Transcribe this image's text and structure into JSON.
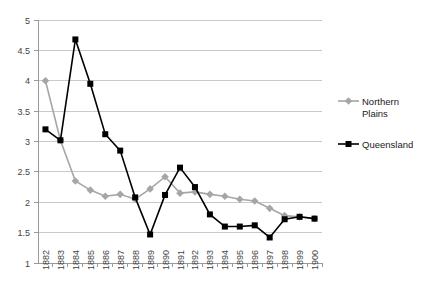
{
  "chart_data": {
    "type": "line",
    "title": "",
    "xlabel": "",
    "ylabel": "",
    "ylim": [
      1,
      5
    ],
    "ytick_step": 0.5,
    "yticks": [
      "1",
      "1.5",
      "2",
      "2.5",
      "3",
      "3.5",
      "4",
      "4.5",
      "5"
    ],
    "grid": true,
    "legend_position": "right",
    "categories": [
      "1882",
      "1883",
      "1884",
      "1885",
      "1886",
      "1887",
      "1888",
      "1889",
      "1890",
      "1891",
      "1892",
      "1893",
      "1894",
      "1895",
      "1896",
      "1897",
      "1898",
      "1899",
      "1900"
    ],
    "series": [
      {
        "name": "Northern Plains",
        "color": "#a6a6a6",
        "marker": "diamond",
        "values": [
          4.0,
          3.02,
          2.35,
          2.2,
          2.1,
          2.13,
          2.05,
          2.22,
          2.42,
          2.15,
          2.17,
          2.13,
          2.1,
          2.05,
          2.02,
          1.9,
          1.78,
          1.76,
          1.73
        ]
      },
      {
        "name": "Queensland",
        "color": "#000000",
        "marker": "square",
        "values": [
          3.2,
          3.02,
          4.68,
          3.95,
          3.12,
          2.85,
          2.08,
          1.47,
          2.12,
          2.57,
          2.25,
          1.8,
          1.6,
          1.6,
          1.62,
          1.42,
          1.72,
          1.76,
          1.73
        ]
      }
    ]
  },
  "legend": {
    "items": [
      {
        "label_line1": "Northern",
        "label_line2": "Plains",
        "color": "#a6a6a6",
        "marker": "diamond"
      },
      {
        "label_line1": "Queensland",
        "label_line2": "",
        "color": "#000000",
        "marker": "square"
      }
    ]
  }
}
